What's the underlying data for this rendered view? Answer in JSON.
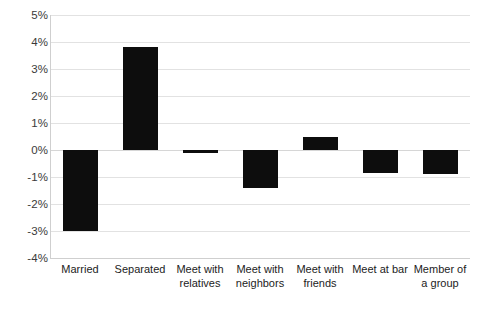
{
  "chart_data": {
    "type": "bar",
    "title": "",
    "subtitle": "",
    "xlabel": "",
    "ylabel": "",
    "ylim": [
      -4,
      5
    ],
    "ytick_step": 1,
    "grid": true,
    "legend": false,
    "legend_position": "none",
    "value_suffix": "%",
    "bar_color": "#0d0d0d",
    "categories": [
      "Married",
      "Separated",
      "Meet with relatives",
      "Meet with neighbors",
      "Meet with friends",
      "Meet at bar",
      "Member of a group"
    ],
    "category_label_lines": [
      "Married",
      "Separated",
      "Meet with\nrelatives",
      "Meet with\nneighbors",
      "Meet with\nfriends",
      "Meet at bar",
      "Member of\na group"
    ],
    "values": [
      -3.0,
      3.8,
      -0.1,
      -1.4,
      0.5,
      -0.85,
      -0.9
    ],
    "ytick_labels": [
      "5%",
      "4%",
      "3%",
      "2%",
      "1%",
      "0%",
      "-1%",
      "-2%",
      "-3%",
      "-4%"
    ],
    "ytick_values": [
      5,
      4,
      3,
      2,
      1,
      0,
      -1,
      -2,
      -3,
      -4
    ]
  }
}
